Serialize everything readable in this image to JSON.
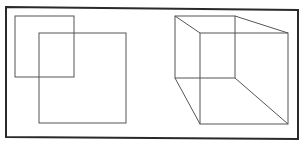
{
  "canvas": {
    "width": 305,
    "height": 144,
    "background": "#ffffff"
  },
  "colors": {
    "frame": "#2a2a2a",
    "line": "#555555"
  },
  "frame": {
    "points": "6,7 298,10 298,139 6,137"
  },
  "left_figure": {
    "name": "overlapping-squares",
    "square_a": {
      "x": 15,
      "y": 16,
      "w": 59,
      "h": 61
    },
    "square_b": {
      "x": 39,
      "y": 33,
      "w": 87,
      "h": 90
    }
  },
  "right_figure": {
    "name": "wireframe-cube",
    "back_face": {
      "x": 175,
      "y": 16,
      "w": 60,
      "h": 62
    },
    "front_face": {
      "x": 200,
      "y": 33,
      "w": 88,
      "h": 91
    },
    "edges": [
      {
        "x1": 175,
        "y1": 16,
        "x2": 200,
        "y2": 33
      },
      {
        "x1": 235,
        "y1": 16,
        "x2": 288,
        "y2": 33
      },
      {
        "x1": 175,
        "y1": 78,
        "x2": 200,
        "y2": 124
      },
      {
        "x1": 235,
        "y1": 78,
        "x2": 288,
        "y2": 124
      }
    ]
  }
}
